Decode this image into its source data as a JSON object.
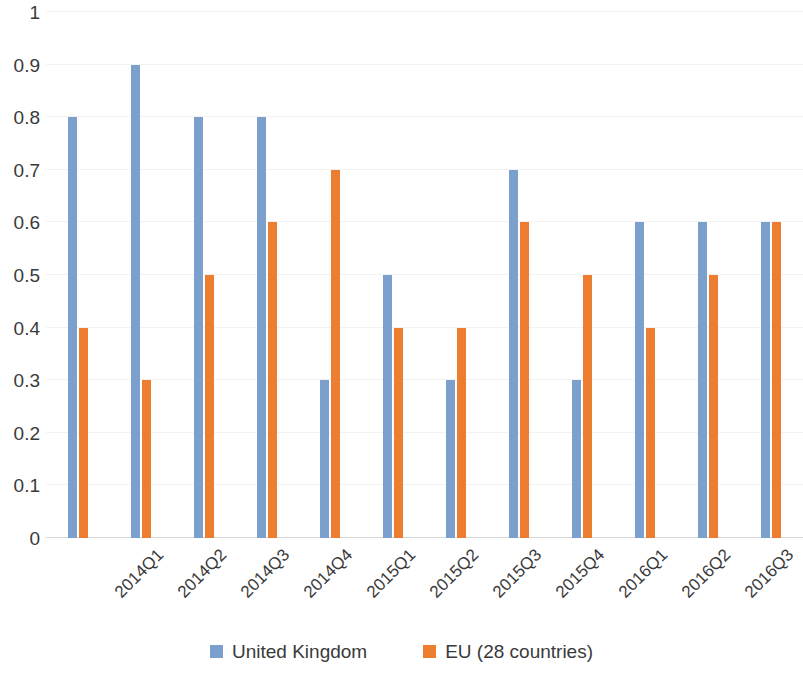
{
  "chart_data": {
    "type": "bar",
    "title": "",
    "subtitle": "",
    "xlabel": "",
    "ylabel": "",
    "ylim": [
      0,
      1
    ],
    "ytick_labels": [
      "0",
      "0.1",
      "0.2",
      "0.3",
      "0.4",
      "0.5",
      "0.6",
      "0.7",
      "0.8",
      "0.9",
      "1"
    ],
    "ytick_values": [
      0,
      0.1,
      0.2,
      0.3,
      0.4,
      0.5,
      0.6,
      0.7,
      0.8,
      0.9,
      1
    ],
    "grid": true,
    "legend_position": "bottom",
    "categories": [
      "2014Q1",
      "2014Q2",
      "2014Q3",
      "2014Q4",
      "2015Q1",
      "2015Q2",
      "2015Q3",
      "2015Q4",
      "2016Q1",
      "2016Q2",
      "2016Q3",
      "2016Q4"
    ],
    "series": [
      {
        "name": "United Kingdom",
        "color": "#7BA0CE",
        "values": [
          0.8,
          0.9,
          0.8,
          0.8,
          0.3,
          0.5,
          0.3,
          0.7,
          0.3,
          0.6,
          0.6,
          0.6
        ]
      },
      {
        "name": "EU (28 countries)",
        "color": "#ED7D31",
        "values": [
          0.4,
          0.3,
          0.5,
          0.6,
          0.7,
          0.4,
          0.4,
          0.6,
          0.5,
          0.4,
          0.5,
          0.6
        ]
      }
    ]
  },
  "legend": {
    "items": [
      {
        "label": "United Kingdom",
        "color": "#7BA0CE"
      },
      {
        "label": "EU (28 countries)",
        "color": "#ED7D31"
      }
    ]
  }
}
